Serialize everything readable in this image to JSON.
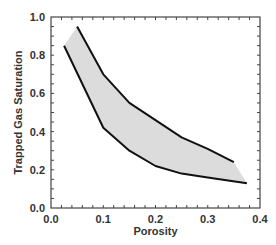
{
  "chart_data": {
    "type": "area",
    "title": "",
    "xlabel": "Porosity",
    "ylabel": "Trapped Gas Saturation",
    "xlim": [
      0.0,
      0.4
    ],
    "ylim": [
      0.0,
      1.0
    ],
    "x_ticks": [
      "0.0",
      "0.1",
      "0.2",
      "0.3",
      "0.4"
    ],
    "y_ticks": [
      "0.0",
      "0.2",
      "0.4",
      "0.6",
      "0.8",
      "1.0"
    ],
    "x_minor_step": 0.02,
    "y_minor_step": 0.05,
    "grid": false,
    "legend": null,
    "series": [
      {
        "name": "Upper bound",
        "x": [
          0.05,
          0.1,
          0.15,
          0.2,
          0.25,
          0.3,
          0.35
        ],
        "y": [
          0.95,
          0.7,
          0.55,
          0.46,
          0.37,
          0.31,
          0.24
        ]
      },
      {
        "name": "Lower bound",
        "x": [
          0.025,
          0.1,
          0.15,
          0.2,
          0.25,
          0.3,
          0.375
        ],
        "y": [
          0.85,
          0.42,
          0.3,
          0.22,
          0.18,
          0.16,
          0.13
        ]
      }
    ],
    "fill_between": true,
    "colors": {
      "line": "#111111",
      "fill": "#dcdcdc",
      "axis": "#444444",
      "text": "#333333"
    }
  }
}
